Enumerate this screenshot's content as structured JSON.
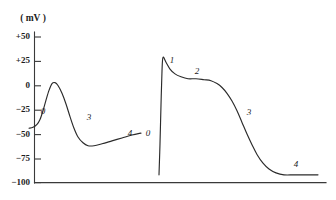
{
  "chart_data": {
    "type": "line",
    "title": "",
    "unit_label": "( mV )",
    "xlabel": "",
    "ylabel": "( mV )",
    "ylim": [
      -100,
      50
    ],
    "yticks": [
      50,
      25,
      0,
      -25,
      -50,
      -75,
      -100
    ],
    "ytick_labels": [
      "+50",
      "+25",
      "0",
      "−25",
      "−50",
      "−75",
      "−100"
    ],
    "grid": false,
    "legend": null,
    "xaxis_visible_ticks": false,
    "series": [
      {
        "name": "pacemaker-action-potential",
        "annotations": [
          {
            "label": "0",
            "x": 43,
            "y": -27
          },
          {
            "label": "3",
            "x": 89,
            "y": -33
          },
          {
            "label": "4",
            "x": 130,
            "y": -50
          }
        ],
        "points": [
          [
            29,
            -44
          ],
          [
            33,
            -43
          ],
          [
            37,
            -40
          ],
          [
            40,
            -35
          ],
          [
            43,
            -26
          ],
          [
            46,
            -15
          ],
          [
            49,
            -5
          ],
          [
            52,
            2
          ],
          [
            55,
            3
          ],
          [
            58,
            0
          ],
          [
            62,
            -8
          ],
          [
            66,
            -19
          ],
          [
            70,
            -32
          ],
          [
            74,
            -44
          ],
          [
            78,
            -53
          ],
          [
            83,
            -59
          ],
          [
            88,
            -62
          ],
          [
            94,
            -62
          ],
          [
            102,
            -60
          ],
          [
            112,
            -57
          ],
          [
            122,
            -54
          ],
          [
            132,
            -51
          ],
          [
            141,
            -49
          ]
        ]
      },
      {
        "name": "cardiac-muscle-action-potential",
        "annotations": [
          {
            "label": "0",
            "x": 148,
            "y": -50
          },
          {
            "label": "1",
            "x": 172,
            "y": 25
          },
          {
            "label": "2",
            "x": 197,
            "y": 14
          },
          {
            "label": "3",
            "x": 249,
            "y": -28
          },
          {
            "label": "4",
            "x": 296,
            "y": -82
          }
        ],
        "points": [
          [
            159,
            -92
          ],
          [
            160,
            -60
          ],
          [
            161,
            -20
          ],
          [
            162,
            15
          ],
          [
            163,
            29
          ],
          [
            166,
            24
          ],
          [
            170,
            17
          ],
          [
            175,
            12
          ],
          [
            181,
            9
          ],
          [
            188,
            7
          ],
          [
            196,
            7
          ],
          [
            204,
            6
          ],
          [
            211,
            5
          ],
          [
            217,
            2
          ],
          [
            222,
            -2
          ],
          [
            227,
            -8
          ],
          [
            232,
            -16
          ],
          [
            237,
            -26
          ],
          [
            242,
            -38
          ],
          [
            247,
            -50
          ],
          [
            252,
            -61
          ],
          [
            257,
            -71
          ],
          [
            263,
            -80
          ],
          [
            269,
            -86
          ],
          [
            276,
            -90
          ],
          [
            284,
            -92
          ],
          [
            294,
            -92
          ],
          [
            306,
            -92
          ],
          [
            318,
            -92
          ]
        ]
      }
    ]
  },
  "axes": {
    "y_axis_name": "voltage-axis",
    "x_axis_name": "time-axis"
  }
}
